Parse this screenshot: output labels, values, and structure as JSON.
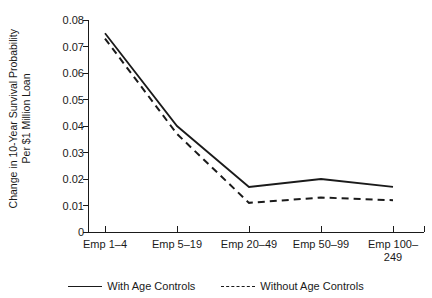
{
  "chart_data": {
    "type": "line",
    "title": "",
    "xlabel": "",
    "ylabel": "Change in 10-Year Survival Probability\nPer $1 Million Loan",
    "categories": [
      "Emp 1–4",
      "Emp 5–19",
      "Emp 20–49",
      "Emp 50–99",
      "Emp 100–\n249"
    ],
    "series": [
      {
        "name": "With Age Controls",
        "style": "solid",
        "values": [
          0.075,
          0.04,
          0.017,
          0.02,
          0.017
        ]
      },
      {
        "name": "Without Age Controls",
        "style": "dashed",
        "values": [
          0.073,
          0.037,
          0.011,
          0.013,
          0.012
        ]
      }
    ],
    "ylim": [
      0,
      0.08
    ],
    "yticks": [
      "0",
      "0.01",
      "0.02",
      "0.03",
      "0.04",
      "0.05",
      "0.06",
      "0.07",
      "0.08"
    ],
    "ytick_values": [
      0,
      0.01,
      0.02,
      0.03,
      0.04,
      0.05,
      0.06,
      0.07,
      0.08
    ],
    "grid": false,
    "legend_position": "bottom",
    "line_color": "#1a1a1a"
  }
}
